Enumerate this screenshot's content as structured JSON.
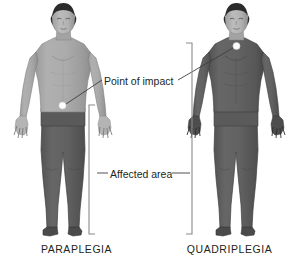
{
  "figure": {
    "kind": "medical-illustration",
    "background_color": "#ffffff"
  },
  "annotations": {
    "point_of_impact": "Point of impact",
    "affected_area": "Affected area"
  },
  "captions": {
    "left": "PARAPLEGIA",
    "right": "QUADRIPLEGIA"
  },
  "figures": [
    {
      "id": "paraplegia",
      "caption": "PARAPLEGIA",
      "impact_point": "lower back / waist",
      "affected_region": "legs and lower body",
      "unaffected_region": "head, arms, torso"
    },
    {
      "id": "quadriplegia",
      "caption": "QUADRIPLEGIA",
      "impact_point": "base of neck",
      "affected_region": "arms, torso, legs",
      "unaffected_region": "head"
    }
  ],
  "colors": {
    "skin_light": "#a8a8a8",
    "skin_shadow": "#939393",
    "affected_dark": "#5e5e5e",
    "affected_dark_shadow": "#535353",
    "hair": "#2b2b2b",
    "outline": "#4a4a4a",
    "impact_dot": "#fdfdfd",
    "leader_line": "#3d3d3d",
    "bracket": "#8a8a8a",
    "text": "#231f20"
  }
}
